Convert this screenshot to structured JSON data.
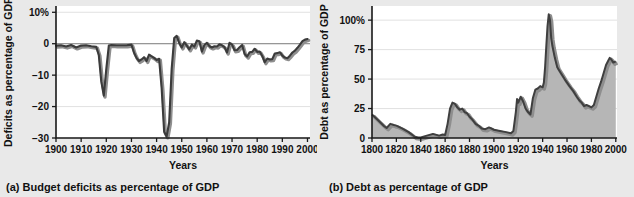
{
  "figure": {
    "background_color": "#e9e9e9",
    "line_color": "#3b3b3b",
    "shadow_color": "#8e8e8e",
    "fill_color": "#b6b6b6"
  },
  "panels": [
    {
      "id": "panel-a",
      "caption": "(a) Budget deficits as percentage of GDP"
    },
    {
      "id": "panel-b",
      "caption": "(b) Debt as percentage of GDP"
    }
  ],
  "chart_data": [
    {
      "type": "line",
      "title": "",
      "xlabel": "Years",
      "ylabel": "Deficits as percentage of GDP",
      "xlim": [
        1900,
        2001
      ],
      "ylim": [
        -30,
        12
      ],
      "xticks": [
        1900,
        1910,
        1920,
        1930,
        1940,
        1950,
        1960,
        1970,
        1980,
        1990,
        2000
      ],
      "xticklabels": [
        "1900",
        "1910",
        "1920",
        "1930",
        "1940",
        "1950",
        "1960",
        "1970",
        "1980",
        "1990",
        "2000"
      ],
      "yticks": [
        10,
        0,
        -10,
        -20,
        -30
      ],
      "yticklabels": [
        "10%",
        "0",
        "−10",
        "−20",
        "−30"
      ],
      "grid": true,
      "zero_line": 0,
      "series": [
        {
          "name": "Budget deficit (% of GDP)",
          "x": [
            1900,
            1902,
            1904,
            1906,
            1908,
            1910,
            1912,
            1914,
            1916,
            1917,
            1918,
            1919,
            1920,
            1921,
            1922,
            1924,
            1926,
            1928,
            1930,
            1931,
            1932,
            1933,
            1934,
            1935,
            1936,
            1937,
            1938,
            1939,
            1940,
            1941,
            1942,
            1943,
            1944,
            1945,
            1946,
            1947,
            1948,
            1949,
            1950,
            1951,
            1952,
            1953,
            1954,
            1955,
            1956,
            1957,
            1958,
            1959,
            1960,
            1961,
            1962,
            1963,
            1964,
            1965,
            1966,
            1967,
            1968,
            1969,
            1970,
            1971,
            1972,
            1973,
            1974,
            1975,
            1976,
            1977,
            1978,
            1979,
            1980,
            1981,
            1982,
            1983,
            1984,
            1985,
            1986,
            1987,
            1988,
            1989,
            1990,
            1991,
            1992,
            1993,
            1994,
            1995,
            1996,
            1997,
            1998,
            1999,
            2000
          ],
          "values": [
            -0.6,
            -0.5,
            -0.9,
            -0.4,
            -1.2,
            -0.6,
            -0.5,
            -0.8,
            -1.0,
            -3.5,
            -12.0,
            -16.5,
            -8.0,
            -0.6,
            -0.4,
            -0.5,
            -0.5,
            -0.5,
            -0.3,
            -2.8,
            -4.5,
            -5.5,
            -5.0,
            -4.3,
            -5.5,
            -3.5,
            -4.0,
            -4.5,
            -5.2,
            -4.8,
            -14.0,
            -28.0,
            -29.5,
            -25.0,
            -8.0,
            1.8,
            2.5,
            0.2,
            -1.2,
            0.5,
            -0.6,
            -1.8,
            -0.3,
            -0.9,
            1.0,
            0.8,
            -2.5,
            -0.4,
            0.3,
            -0.8,
            -1.2,
            -0.8,
            -0.9,
            -0.2,
            -0.5,
            -1.1,
            -2.8,
            0.3,
            -0.3,
            -2.1,
            -2.0,
            -1.1,
            -0.4,
            -3.3,
            -4.1,
            -2.7,
            -2.6,
            -1.6,
            -2.6,
            -2.5,
            -3.9,
            -5.9,
            -4.7,
            -5.0,
            -4.9,
            -3.1,
            -3.0,
            -2.7,
            -3.8,
            -4.4,
            -4.6,
            -3.8,
            -2.8,
            -2.2,
            -1.3,
            -0.3,
            0.8,
            1.3,
            1.5
          ]
        }
      ]
    },
    {
      "type": "area",
      "title": "",
      "xlabel": "Years",
      "ylabel": "Debt as percentage of GDP",
      "xlim": [
        1800,
        2001
      ],
      "ylim": [
        0,
        112
      ],
      "xticks": [
        1800,
        1820,
        1840,
        1860,
        1880,
        1900,
        1920,
        1940,
        1960,
        1980,
        2000
      ],
      "xticklabels": [
        "1800",
        "1820",
        "1840",
        "1860",
        "1880",
        "1900",
        "1920",
        "1940",
        "1960",
        "1980",
        "2000"
      ],
      "yticks": [
        100,
        75,
        50,
        25,
        0
      ],
      "yticklabels": [
        "100%",
        "75",
        "50",
        "25",
        "0"
      ],
      "grid": true,
      "series": [
        {
          "name": "Debt (% of GDP)",
          "x": [
            1800,
            1805,
            1810,
            1812,
            1815,
            1818,
            1820,
            1825,
            1830,
            1835,
            1838,
            1840,
            1845,
            1850,
            1855,
            1858,
            1860,
            1862,
            1864,
            1866,
            1868,
            1870,
            1872,
            1874,
            1876,
            1878,
            1880,
            1882,
            1885,
            1888,
            1890,
            1893,
            1896,
            1900,
            1905,
            1910,
            1914,
            1916,
            1918,
            1919,
            1920,
            1922,
            1924,
            1926,
            1928,
            1930,
            1932,
            1934,
            1936,
            1938,
            1940,
            1941,
            1942,
            1943,
            1944,
            1945,
            1946,
            1947,
            1948,
            1950,
            1952,
            1955,
            1958,
            1960,
            1962,
            1965,
            1968,
            1970,
            1972,
            1974,
            1976,
            1978,
            1980,
            1982,
            1984,
            1986,
            1988,
            1990,
            1992,
            1994,
            1995,
            1996,
            1998,
            2000
          ],
          "values": [
            20.0,
            15.0,
            10.0,
            8.5,
            12.0,
            11.0,
            10.5,
            8.0,
            5.0,
            1.0,
            0.5,
            0.5,
            2.0,
            3.5,
            2.0,
            3.0,
            2.5,
            12.0,
            25.0,
            30.0,
            29.0,
            26.0,
            24.0,
            25.0,
            22.0,
            21.0,
            18.0,
            16.0,
            12.0,
            10.0,
            8.0,
            7.5,
            9.0,
            7.0,
            6.0,
            5.0,
            4.0,
            6.0,
            22.0,
            33.0,
            30.0,
            35.0,
            31.0,
            25.0,
            22.0,
            20.0,
            34.0,
            41.0,
            42.0,
            44.0,
            43.0,
            47.0,
            60.0,
            78.0,
            95.0,
            105.0,
            100.0,
            85.0,
            78.0,
            68.0,
            60.0,
            55.0,
            50.0,
            47.0,
            44.0,
            40.0,
            35.0,
            32.0,
            30.0,
            27.0,
            28.0,
            27.0,
            26.0,
            28.0,
            35.0,
            42.0,
            48.0,
            55.0,
            62.0,
            66.0,
            68.0,
            67.0,
            64.0,
            65.0
          ]
        }
      ]
    }
  ]
}
